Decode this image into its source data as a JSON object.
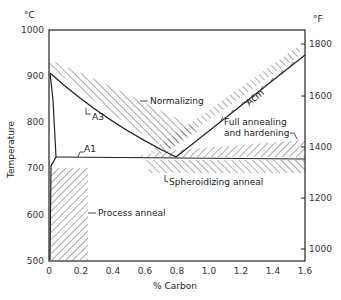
{
  "diagram": {
    "type": "iron-carbon heat treatment ranges",
    "left_axis": {
      "unit": "°C",
      "label": "Temperature",
      "ticks": [
        "1000",
        "900",
        "800",
        "700",
        "600",
        "500"
      ],
      "range": [
        500,
        1000
      ]
    },
    "right_axis": {
      "unit": "°F",
      "ticks": [
        "1800",
        "1600",
        "1400",
        "1200",
        "1000"
      ]
    },
    "x_axis": {
      "label": "% Carbon",
      "ticks": [
        "0",
        "0.2",
        "0.4",
        "0.6",
        "0.8",
        "1.0",
        "1.2",
        "1.4",
        "1.6"
      ],
      "range": [
        0,
        1.6
      ]
    },
    "curves": {
      "a3": "A3",
      "a1": "A1",
      "acm": "Acm"
    },
    "regions": {
      "normalizing": "Normalizing",
      "full_annealing_line1": "Full annealing",
      "full_annealing_line2": "and hardening",
      "spheroidizing": "Spheroidizing anneal",
      "process_anneal": "Process anneal"
    },
    "colors": {
      "line": "#222222",
      "hatch": "#444444",
      "background": "#ffffff"
    }
  }
}
